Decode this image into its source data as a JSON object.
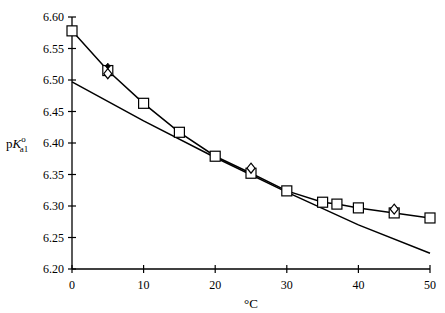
{
  "chart_data": {
    "type": "line",
    "title": "",
    "xlabel": "°C",
    "ylabel": "pK°a1",
    "ylabel_parts": {
      "p": "p",
      "K": "K",
      "sup": "o",
      "sub": "a1"
    },
    "xlim": [
      0,
      50
    ],
    "ylim": [
      6.2,
      6.6
    ],
    "x_ticks": [
      "0",
      "10",
      "20",
      "30",
      "40",
      "50"
    ],
    "y_ticks": [
      "6.20",
      "6.25",
      "6.30",
      "6.35",
      "6.40",
      "6.45",
      "6.50",
      "6.55",
      "6.60"
    ],
    "grid": false,
    "legend": null,
    "series": [
      {
        "name": "squares (connected)",
        "marker": "square",
        "x": [
          0,
          5,
          10,
          15,
          20,
          25,
          30,
          35,
          37,
          40,
          45,
          50
        ],
        "y": [
          6.578,
          6.515,
          6.463,
          6.417,
          6.379,
          6.352,
          6.324,
          6.306,
          6.303,
          6.297,
          6.289,
          6.281
        ]
      },
      {
        "name": "diamonds",
        "marker": "diamond",
        "x": [
          5,
          25,
          45
        ],
        "y": [
          6.51,
          6.36,
          6.295
        ]
      },
      {
        "name": "filled points",
        "marker": "filled-diamond",
        "x": [
          5
        ],
        "y": [
          6.522
        ]
      },
      {
        "name": "smooth curve",
        "marker": "none",
        "x": [
          0,
          10,
          20,
          30,
          40,
          50
        ],
        "y": [
          6.497,
          6.435,
          6.377,
          6.322,
          6.27,
          6.225
        ]
      }
    ]
  }
}
